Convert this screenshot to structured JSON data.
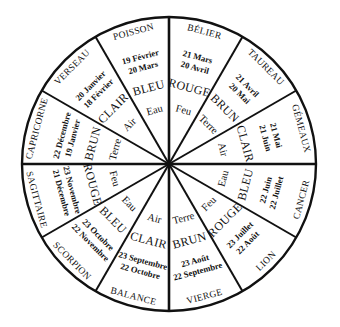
{
  "diagram": {
    "type": "zodiac-wheel",
    "center": [
      169,
      164
    ],
    "radius": 147,
    "stroke_color": "#111111",
    "background": "#ffffff",
    "sector_angle_deg": 30,
    "signs": [
      {
        "name": "BÉLIER",
        "dates": [
          "21 Mars",
          "20 Avril"
        ],
        "color": "ROUGE",
        "element": "Feu",
        "center_deg": 15
      },
      {
        "name": "TAUREAU",
        "dates": [
          "21 Avril",
          "20 Mai"
        ],
        "color": "BRUN",
        "element": "Terre",
        "center_deg": 45
      },
      {
        "name": "GÉMEAUX",
        "dates": [
          "21 Mai",
          "21 Juin"
        ],
        "color": "CLAIR",
        "element": "Air",
        "center_deg": 75
      },
      {
        "name": "CANCER",
        "dates": [
          "22 Juin",
          "22 Juillet"
        ],
        "color": "BLEU",
        "element": "Eau",
        "center_deg": 105
      },
      {
        "name": "LION",
        "dates": [
          "23 Juillet",
          "22 Août"
        ],
        "color": "ROUGE",
        "element": "Feu",
        "center_deg": 135
      },
      {
        "name": "VIERGE",
        "dates": [
          "23 Août",
          "22 Septembre"
        ],
        "color": "BRUN",
        "element": "Terre",
        "center_deg": 165
      },
      {
        "name": "BALANCE",
        "dates": [
          "23 Septembre",
          "22 Octobre"
        ],
        "color": "CLAIR",
        "element": "Air",
        "center_deg": 195
      },
      {
        "name": "SCORPION",
        "dates": [
          "23 Octobre",
          "22 Novembre"
        ],
        "color": "BLEU",
        "element": "Eau",
        "center_deg": 225
      },
      {
        "name": "SAGITTAIRE",
        "dates": [
          "23 Novembre",
          "21 Décembre"
        ],
        "color": "ROUGE",
        "element": "Feu",
        "center_deg": 255
      },
      {
        "name": "CAPRICORNE",
        "dates": [
          "22 Décembre",
          "19 Janvier"
        ],
        "color": "BRUN",
        "element": "Terre",
        "center_deg": 285
      },
      {
        "name": "VERSEAU",
        "dates": [
          "20 Janvier",
          "18 Février"
        ],
        "color": "CLAIR",
        "element": "Air",
        "center_deg": 315
      },
      {
        "name": "POISSON",
        "dates": [
          "19 Février",
          "20 Mars"
        ],
        "color": "BLEU",
        "element": "Eau",
        "center_deg": 345
      }
    ]
  }
}
